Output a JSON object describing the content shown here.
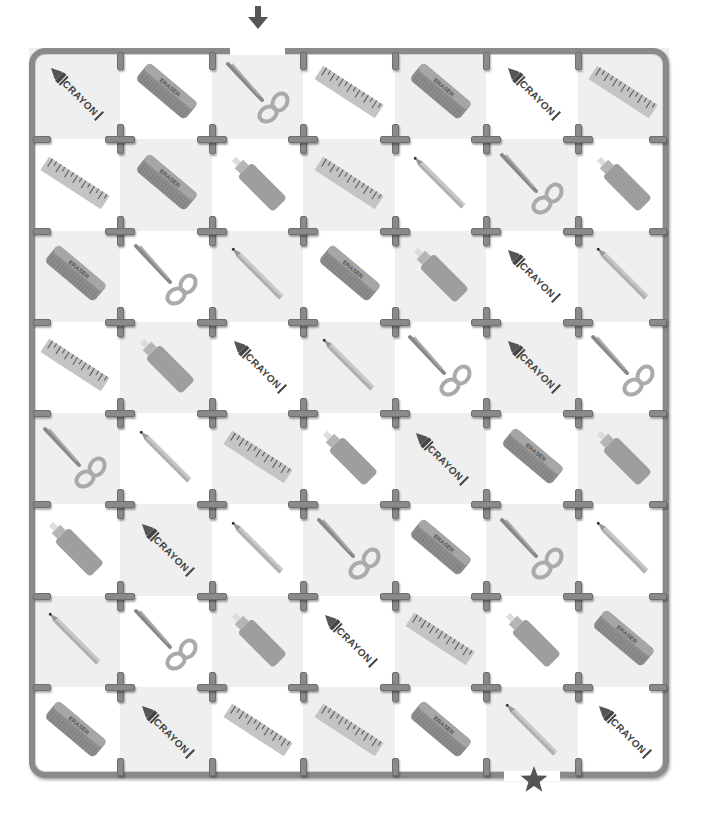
{
  "puzzle": {
    "type": "maze",
    "columns": 7,
    "rows": 8,
    "start_marker": "down-arrow-icon",
    "end_marker": "star-icon",
    "start_column": 3,
    "end_column": 6,
    "colors": {
      "wall": "#8a8a8a",
      "shade_cell": "#efefef",
      "light_cell": "#ffffff",
      "marker": "#555555"
    }
  },
  "grid": [
    [
      "crayon",
      "eraser",
      "scissors",
      "ruler",
      "eraser",
      "crayon",
      "ruler"
    ],
    [
      "ruler",
      "eraser",
      "glue",
      "ruler",
      "pencil",
      "scissors",
      "glue"
    ],
    [
      "eraser",
      "scissors",
      "pencil",
      "eraser",
      "glue",
      "crayon",
      "pencil"
    ],
    [
      "ruler",
      "glue",
      "crayon",
      "pencil",
      "scissors",
      "crayon",
      "scissors"
    ],
    [
      "scissors",
      "pencil",
      "ruler",
      "glue",
      "crayon",
      "eraser",
      "glue"
    ],
    [
      "glue",
      "crayon",
      "pencil",
      "scissors",
      "eraser",
      "scissors",
      "pencil"
    ],
    [
      "pencil",
      "scissors",
      "glue",
      "crayon",
      "ruler",
      "glue",
      "eraser"
    ],
    [
      "eraser",
      "crayon",
      "ruler",
      "ruler",
      "eraser",
      "pencil",
      "crayon"
    ]
  ],
  "labels": {
    "crayon": "CRAYON",
    "eraser": "ERASER"
  }
}
